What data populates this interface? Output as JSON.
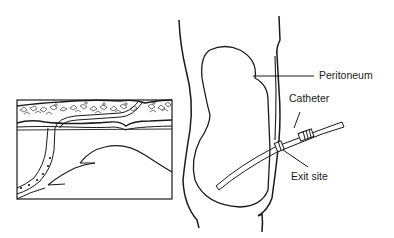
{
  "diagram": {
    "labels": {
      "peritoneum": "Peritoneum",
      "catheter": "Catheter",
      "exit_site": "Exit site"
    },
    "colors": {
      "line": "#1a1a1a",
      "background": "#ffffff"
    },
    "inset": {
      "description": "Cross-section of abdominal wall showing tunneled catheter with cuffs"
    }
  }
}
